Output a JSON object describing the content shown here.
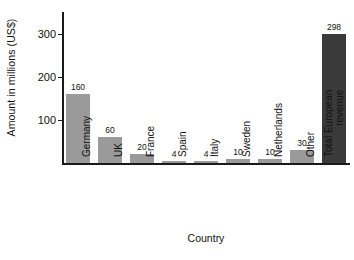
{
  "chart_data": {
    "type": "bar",
    "title": "",
    "xlabel": "Country",
    "ylabel": "Amount in millions (US$)",
    "categories": [
      "Germany",
      "UK",
      "France",
      "Spain",
      "Italy",
      "Sweden",
      "Netherlands",
      "Other",
      "Total European revenue"
    ],
    "values": [
      160,
      60,
      20,
      4,
      4,
      10,
      10,
      30,
      298
    ],
    "value_labels": [
      "160",
      "60",
      "20",
      "4",
      "4",
      "10",
      "10",
      "30",
      "298"
    ],
    "ylim": [
      0,
      350
    ],
    "yticks": [
      100,
      200,
      300
    ],
    "ytick_labels": [
      "100",
      "200",
      "300"
    ],
    "grid": false,
    "legend": false,
    "highlight_index": 8,
    "colors": {
      "bar": "#9a9a9a",
      "highlight_bar": "#3a3a3a",
      "axis": "#1a1a1a",
      "text": "#111111",
      "background": "#ffffff"
    }
  }
}
